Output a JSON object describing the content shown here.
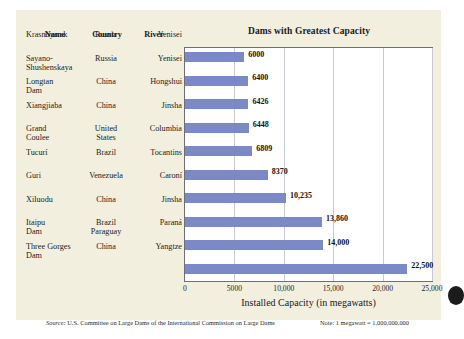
{
  "figure": {
    "background_color": "#f2efdf",
    "bar_color": "#7b8ac7"
  },
  "table": {
    "headers": {
      "name": "Name",
      "country": "Country",
      "river": "River"
    },
    "rows": [
      {
        "name": "Krasnoyarsk",
        "name2": "",
        "country": "Russia",
        "country2": "",
        "river": "Yenisei"
      },
      {
        "name": "Sayano-",
        "name2": "Shushenskaya",
        "country": "Russia",
        "country2": "",
        "river": "Yenisei"
      },
      {
        "name": "Longtan",
        "name2": "Dam",
        "country": "China",
        "country2": "",
        "river": "Hongshui"
      },
      {
        "name": "Xiangjiaba",
        "name2": "",
        "country": "China",
        "country2": "",
        "river": "Jinsha"
      },
      {
        "name": "Grand",
        "name2": "Coulee",
        "country": "United",
        "country2": "States",
        "river": "Columbia"
      },
      {
        "name": "Tucurí",
        "name2": "",
        "country": "Brazil",
        "country2": "",
        "river": "Tocantins"
      },
      {
        "name": "Guri",
        "name2": "",
        "country": "Venezuela",
        "country2": "",
        "river": "Caroní"
      },
      {
        "name": "Xiluodu",
        "name2": "",
        "country": "China",
        "country2": "",
        "river": "Jinsha"
      },
      {
        "name": "Itaipu",
        "name2": "Dam",
        "country": "Brazil",
        "country2": "Paraguay",
        "river": "Paraná"
      },
      {
        "name": "Three Gorges",
        "name2": "Dam",
        "country": "China",
        "country2": "",
        "river": "Yangtze"
      }
    ]
  },
  "chart_data": {
    "type": "bar",
    "orientation": "horizontal",
    "title": "Dams with Greatest Capacity",
    "xlabel": "Installed Capacity (in megawatts)",
    "ylabel": "",
    "xlim": [
      0,
      25000
    ],
    "grid": true,
    "legend": "none",
    "categories": [
      "Krasnoyarsk",
      "Sayano-Shushenskaya",
      "Longtan Dam",
      "Xiangjiaba",
      "Grand Coulee",
      "Tucurí",
      "Guri",
      "Xiluodu",
      "Itaipu Dam",
      "Three Gorges Dam"
    ],
    "values": [
      6000,
      6400,
      6426,
      6448,
      6809,
      8370,
      10235,
      13860,
      14000,
      22500
    ],
    "value_labels": [
      "6000",
      "6400",
      "6426",
      "6448",
      "6809",
      "8370",
      "10,235",
      "13,860",
      "14,000",
      "22,500"
    ],
    "xticks": [
      0,
      5000,
      10000,
      15000,
      20000,
      25000
    ],
    "xtick_labels": [
      "0",
      "5000",
      "10,000",
      "15,000",
      "20,000",
      "25,000"
    ]
  },
  "footer": {
    "source_word": "Source:",
    "source_text": " U.S. Committee on Large Dams of the International Commission on Large Dams",
    "note": "Note: 1 megawatt = 1,000,000,000"
  }
}
